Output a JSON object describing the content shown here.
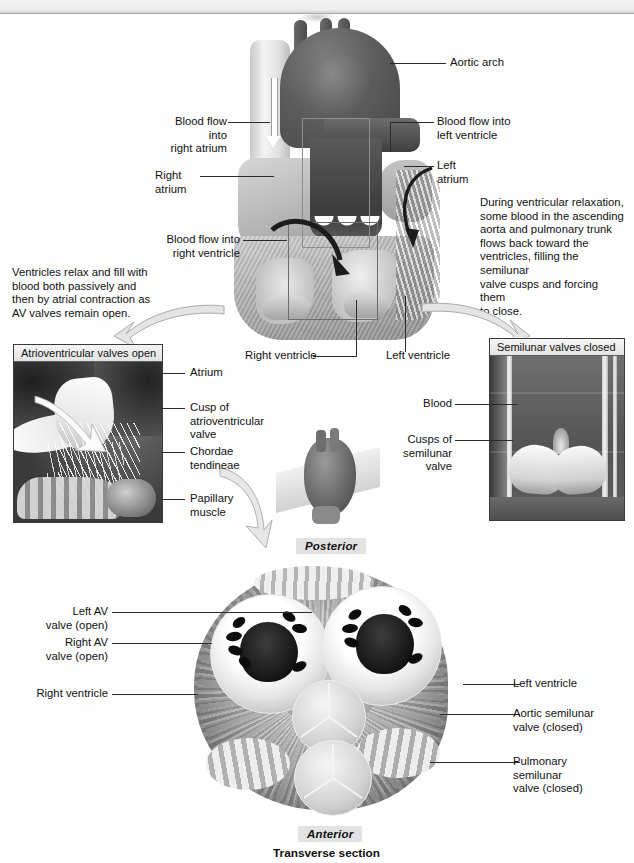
{
  "figure": {
    "caption": "Transverse section",
    "orientation_top": "Posterior",
    "orientation_bottom": "Anterior"
  },
  "main_heart": {
    "labels": {
      "aortic_arch": "Aortic arch",
      "blood_flow_right_atrium": "Blood flow into\nright atrium",
      "right_atrium": "Right\natrium",
      "blood_flow_left_ventricle": "Blood flow into\nleft ventricle",
      "left_atrium": "Left\natrium",
      "blood_flow_right_ventricle": "Blood flow into\nright ventricle",
      "right_ventricle": "Right ventricle",
      "left_ventricle": "Left ventricle"
    }
  },
  "annotations": {
    "left_text": "Ventricles relax and fill with\nblood both passively and\nthen by atrial contraction as\nAV valves remain open.",
    "right_text": "During ventricular relaxation,\nsome blood in the ascending\naorta and pulmonary trunk\nflows back toward the\nventricles, filling the semilunar\nvalve cusps and forcing them\nto close."
  },
  "inset_left": {
    "title": "Atrioventricular valves open",
    "labels": [
      "Atrium",
      "Cusp of\natrioventricular\nvalve",
      "Chordae\ntendineae",
      "Papillary\nmuscle"
    ]
  },
  "inset_right": {
    "title": "Semilunar valves closed",
    "labels": [
      "Blood",
      "Cusps of\nsemilunar\nvalve"
    ]
  },
  "transverse": {
    "labels_left": [
      "Left AV\nvalve (open)",
      "Right AV\nvalve (open)",
      "Right ventricle"
    ],
    "labels_right": [
      "Left ventricle",
      "Aortic semilunar\nvalve (closed)",
      "Pulmonary\nsemilunar\nvalve (closed)"
    ]
  },
  "colors": {
    "ink": "#111111",
    "leader": "#2b2b2b",
    "panel_border": "#3a3a3a",
    "panel_header_bg": "#e9e9e9",
    "chip_bg": "#e2e2e2",
    "page_bg": "#ffffff"
  }
}
